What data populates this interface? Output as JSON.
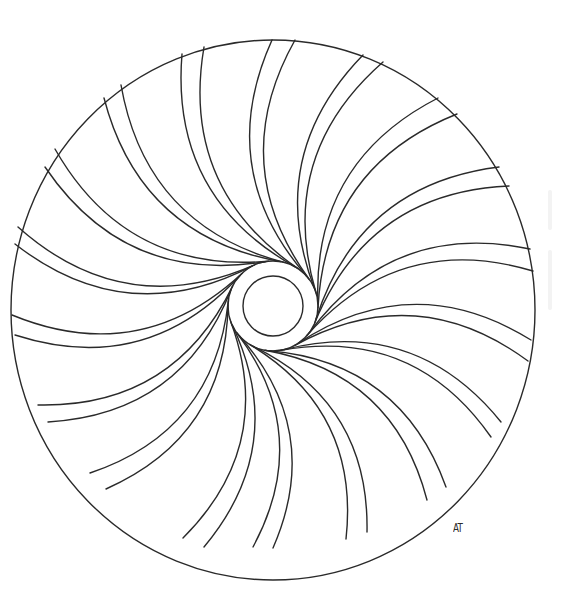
{
  "artwork": {
    "title": "Swirl mandala coloring page",
    "line_color": "#2a2a2a",
    "background": "#ffffff",
    "outer_circle": {
      "cx": 273,
      "cy": 310,
      "rx": 262,
      "ry": 270
    },
    "center_ring_outer": {
      "cx": 273,
      "cy": 306,
      "r": 45
    },
    "center_ring_inner": {
      "cx": 273,
      "cy": 306,
      "r": 30
    },
    "signature": {
      "text": "AT",
      "x": 453,
      "y": 520
    },
    "swirl_bend": 0.32,
    "curve_pairs": [
      {
        "outer": [
          [
            272,
            40
          ],
          [
            295,
            40
          ]
        ]
      },
      {
        "outer": [
          [
            363,
            55
          ],
          [
            383,
            62
          ]
        ]
      },
      {
        "outer": [
          [
            438,
            98
          ],
          [
            457,
            114
          ]
        ]
      },
      {
        "outer": [
          [
            499,
            167
          ],
          [
            509,
            186
          ]
        ]
      },
      {
        "outer": [
          [
            530,
            249
          ],
          [
            533,
            271
          ]
        ]
      },
      {
        "outer": [
          [
            531,
            340
          ],
          [
            528,
            361
          ]
        ]
      },
      {
        "outer": [
          [
            501,
            422
          ],
          [
            491,
            437
          ]
        ]
      },
      {
        "outer": [
          [
            446,
            487
          ],
          [
            427,
            500
          ]
        ]
      },
      {
        "outer": [
          [
            367,
            532
          ],
          [
            346,
            539
          ]
        ]
      },
      {
        "outer": [
          [
            273,
            548
          ],
          [
            253,
            547
          ]
        ]
      },
      {
        "outer": [
          [
            204,
            547
          ],
          [
            183,
            538
          ]
        ]
      },
      {
        "outer": [
          [
            106,
            489
          ],
          [
            90,
            473
          ]
        ]
      },
      {
        "outer": [
          [
            48,
            422
          ],
          [
            38,
            405
          ]
        ]
      },
      {
        "outer": [
          [
            15,
            335
          ],
          [
            12,
            315
          ]
        ]
      },
      {
        "outer": [
          [
            15,
            244
          ],
          [
            18,
            227
          ]
        ]
      },
      {
        "outer": [
          [
            45,
            167
          ],
          [
            55,
            149
          ]
        ]
      },
      {
        "outer": [
          [
            104,
            98
          ],
          [
            121,
            85
          ]
        ]
      },
      {
        "outer": [
          [
            182,
            54
          ],
          [
            204,
            47
          ]
        ]
      }
    ]
  }
}
